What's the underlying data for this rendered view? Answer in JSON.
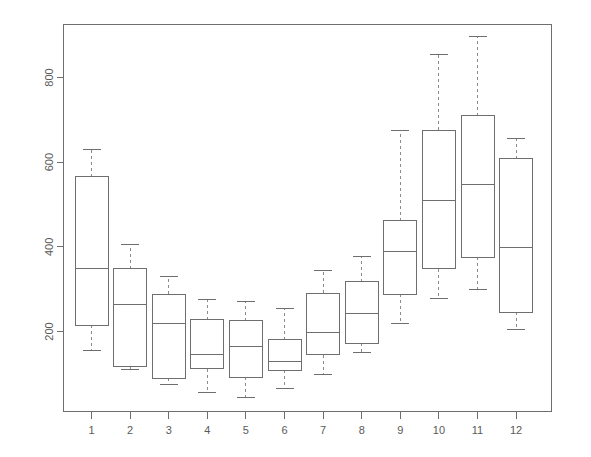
{
  "chart_data": {
    "type": "boxplot",
    "title": "",
    "xlabel": "",
    "ylabel": "",
    "grid": false,
    "legend": null,
    "xlim": [
      0.5,
      12.5
    ],
    "ylim": [
      0,
      940
    ],
    "x_tick_labels": [
      "1",
      "2",
      "3",
      "4",
      "5",
      "6",
      "7",
      "8",
      "9",
      "10",
      "11",
      "12"
    ],
    "y_tick_labels": [
      "200",
      "400",
      "600",
      "800"
    ],
    "y_tick_values": [
      200,
      400,
      600,
      800
    ],
    "categories": [
      "1",
      "2",
      "3",
      "4",
      "5",
      "6",
      "7",
      "8",
      "9",
      "10",
      "11",
      "12"
    ],
    "boxes": [
      {
        "category": "1",
        "whisker_low": 155,
        "q1": 215,
        "median": 350,
        "q3": 565,
        "whisker_high": 630
      },
      {
        "category": "2",
        "whisker_low": 110,
        "q1": 118,
        "median": 263,
        "q3": 348,
        "whisker_high": 405
      },
      {
        "category": "3",
        "whisker_low": 75,
        "q1": 90,
        "median": 220,
        "q3": 288,
        "whisker_high": 330
      },
      {
        "category": "4",
        "whisker_low": 55,
        "q1": 112,
        "median": 145,
        "q3": 228,
        "whisker_high": 275
      },
      {
        "category": "5",
        "whisker_low": 45,
        "q1": 92,
        "median": 165,
        "q3": 225,
        "whisker_high": 270
      },
      {
        "category": "6",
        "whisker_low": 65,
        "q1": 108,
        "median": 130,
        "q3": 180,
        "whisker_high": 255
      },
      {
        "category": "7",
        "whisker_low": 98,
        "q1": 145,
        "median": 197,
        "q3": 290,
        "whisker_high": 345
      },
      {
        "category": "8",
        "whisker_low": 150,
        "q1": 172,
        "median": 242,
        "q3": 318,
        "whisker_high": 378
      },
      {
        "category": "9",
        "whisker_low": 220,
        "q1": 288,
        "median": 390,
        "q3": 462,
        "whisker_high": 675
      },
      {
        "category": "10",
        "whisker_low": 278,
        "q1": 348,
        "median": 510,
        "q3": 675,
        "whisker_high": 855
      },
      {
        "category": "11",
        "whisker_low": 300,
        "q1": 375,
        "median": 548,
        "q3": 710,
        "whisker_high": 898
      },
      {
        "category": "12",
        "whisker_low": 205,
        "q1": 245,
        "median": 398,
        "q3": 608,
        "whisker_high": 655
      }
    ],
    "colors": {
      "line": "#6e6e6e",
      "whisker": "#8a8a8a",
      "text": "#5a5a5a",
      "background": "#ffffff"
    }
  }
}
